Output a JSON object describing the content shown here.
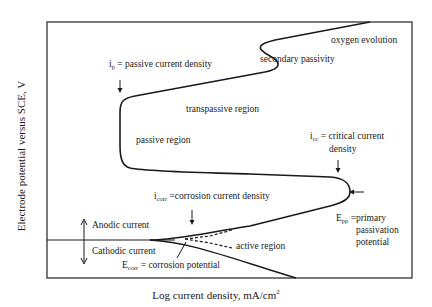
{
  "axes": {
    "ylabel": "Electrode potential versus SCE, V",
    "xlabel": "Log current density, mA/cm",
    "xlabel_sup": "2"
  },
  "labels": {
    "oxygen_evolution": "oxygen evolution",
    "secondary_passivity": "secondary passivity",
    "ip_symbol": "i",
    "ip_sub": "p",
    "ip_text": " = passive current density",
    "transpassive": "transpassive region",
    "passive": "passive region",
    "icc_symbol": "i",
    "icc_sub": "cc",
    "icc_text": " = critical current",
    "icc_text2": "density",
    "icorr_symbol": "i",
    "icorr_sub": "corr",
    "icorr_text": " =corrosion current density",
    "epp_symbol": "E",
    "epp_sub": "pp",
    "epp_text": " =primary",
    "epp_text2": "passivation",
    "epp_text3": "potential",
    "anodic": "Anodic current",
    "cathodic": "Cathodic current",
    "ecorr_symbol": "E",
    "ecorr_sub": "corr",
    "ecorr_text": " = corrosion potential",
    "active": "active region"
  },
  "colors": {
    "line": "#1a1a1a",
    "background": "#ffffff"
  }
}
